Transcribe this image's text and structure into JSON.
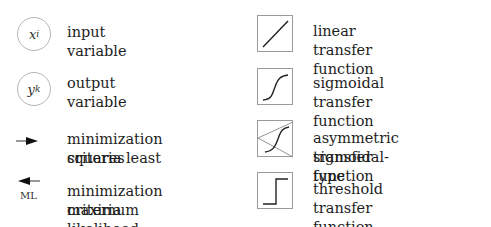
{
  "legend": {
    "left": [
      {
        "symbol": "circle",
        "var": "x",
        "sub": "i",
        "label": "input variable"
      },
      {
        "symbol": "circle",
        "var": "y",
        "sub": "k",
        "label": "output variable"
      },
      {
        "symbol": "arrow-right",
        "label_line1": "minimization criteria least",
        "label_line2": "squares"
      },
      {
        "symbol": "arrow-left",
        "tag": "ML",
        "label_line1": "minimization criteria",
        "label_line2": "maximum likelihood"
      }
    ],
    "right": [
      {
        "symbol": "linear",
        "label": "linear transfer function"
      },
      {
        "symbol": "sigmoid",
        "label": "sigmoidal transfer function"
      },
      {
        "symbol": "asym-sigmoid",
        "label_line1": "asymmetric sigmoidal-type",
        "label_line2": "transfer function"
      },
      {
        "symbol": "threshold",
        "label": "threshold transfer function"
      }
    ]
  }
}
